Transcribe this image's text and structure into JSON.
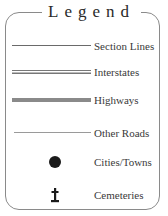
{
  "legend": {
    "title": "Legend",
    "items": [
      {
        "label": "Section Lines",
        "symbol": "thin-line"
      },
      {
        "label": "Interstates",
        "symbol": "double-line"
      },
      {
        "label": "Highways",
        "symbol": "thick-gray-line"
      },
      {
        "label": "Other Roads",
        "symbol": "light-thin-line"
      },
      {
        "label": "Cities/Towns",
        "symbol": "black-dot"
      },
      {
        "label": "Cemeteries",
        "symbol": "cross-marker"
      }
    ],
    "colors": {
      "frame": "#8a8a8a",
      "text": "#3a3a3a",
      "highway": "#8a8a8a",
      "city_dot": "#1a1a1a"
    }
  }
}
